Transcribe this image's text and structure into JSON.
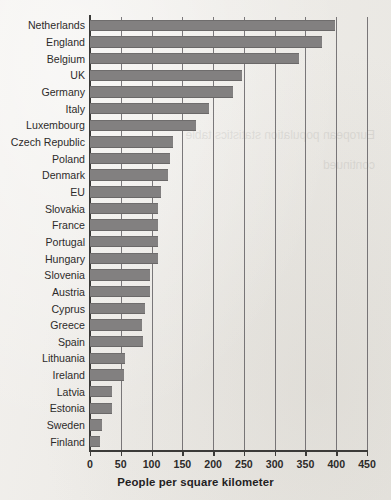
{
  "title": {
    "text": "POPULATION DENSITY — EUROPEAN COUNTRIES",
    "clipped": true
  },
  "xaxis_title": "People per square kilometer",
  "tick_labels": [
    "0",
    "50",
    "100",
    "150",
    "200",
    "250",
    "300",
    "350",
    "400",
    "450"
  ],
  "colors": {
    "bar_fill": "#828080",
    "paper": "#efedea",
    "axis": "#3b3a38",
    "gridline": "#58565a",
    "text": "#2d2b2a"
  },
  "chart_data": {
    "type": "bar",
    "orientation": "horizontal",
    "title": "POPULATION DENSITY — EUROPEAN COUNTRIES",
    "xlabel": "People per square kilometer",
    "ylabel": "",
    "xlim": [
      0,
      450
    ],
    "xticks": [
      0,
      50,
      100,
      150,
      200,
      250,
      300,
      350,
      400,
      450
    ],
    "grid": true,
    "grid_axis": "x",
    "legend": null,
    "categories": [
      "Netherlands",
      "England",
      "Belgium",
      "UK",
      "Germany",
      "Italy",
      "Luxembourg",
      "Czech Republic",
      "Poland",
      "Denmark",
      "EU",
      "Slovakia",
      "France",
      "Portugal",
      "Hungary",
      "Slovenia",
      "Austria",
      "Cyprus",
      "Greece",
      "Spain",
      "Lithuania",
      "Ireland",
      "Latvia",
      "Estonia",
      "Sweden",
      "Finland"
    ],
    "values": [
      398,
      377,
      340,
      247,
      232,
      193,
      172,
      135,
      130,
      127,
      115,
      110,
      110,
      110,
      111,
      98,
      98,
      89,
      84,
      86,
      57,
      55,
      36,
      35,
      20,
      17
    ]
  }
}
